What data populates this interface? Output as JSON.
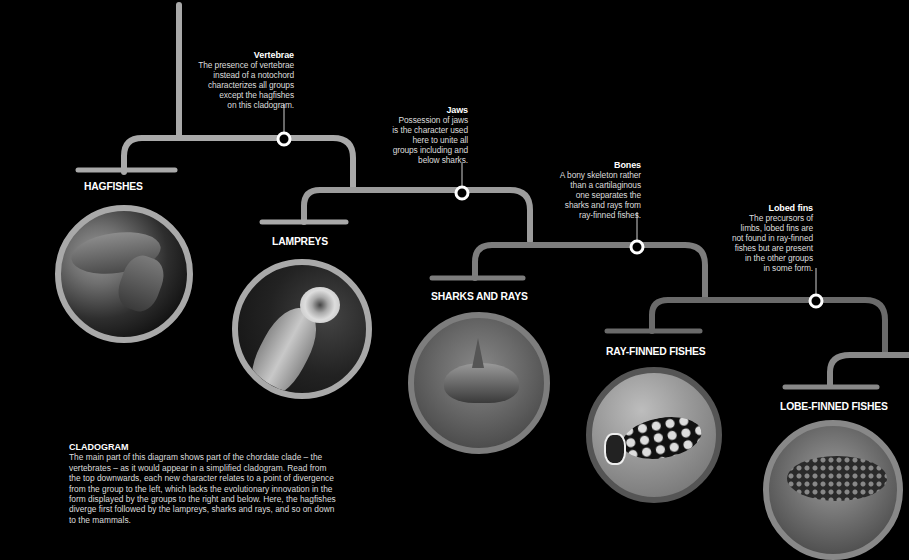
{
  "colors": {
    "background": "#000000",
    "branch_light": "#a9a9a9",
    "branch_mid": "#8a8a8a",
    "branch_dark": "#6a6a6a",
    "node_ring": "#ffffff",
    "text": "#ffffff"
  },
  "characters": [
    {
      "title": "Vertebrae",
      "text": "The presence of vertebrae instead of a notochord characterizes all groups except the hagfishes on this cladogram."
    },
    {
      "title": "Jaws",
      "text": "Possession of jaws is the character used here to unite all groups including and below sharks."
    },
    {
      "title": "Bones",
      "text": "A bony skeleton rather than a cartilaginous one separates the sharks and rays from ray-finned fishes."
    },
    {
      "title": "Lobed fins",
      "text": "The precursors of limbs, lobed fins are not found in ray-finned fishes but are present in the other groups in some form."
    }
  ],
  "char_lines": [
    [
      "The presence of vertebrae",
      "instead of a notochord",
      "characterizes all groups",
      "except the hagfishes",
      "on this cladogram."
    ],
    [
      "Possession of jaws",
      "is the character used",
      "here to unite all",
      "groups including and",
      "below sharks."
    ],
    [
      "A bony skeleton rather",
      "than a cartilaginous",
      "one separates the",
      "sharks and rays from",
      "ray-finned fishes."
    ],
    [
      "The precursors of",
      "limbs, lobed fins are",
      "not found in ray-finned",
      "fishes but are present",
      "in the other groups",
      "in some form."
    ]
  ],
  "groups": [
    {
      "name": "HAGFISHES",
      "photo": "hagfish-photo"
    },
    {
      "name": "LAMPREYS",
      "photo": "lamprey-photo"
    },
    {
      "name": "SHARKS AND RAYS",
      "photo": "shark-photo"
    },
    {
      "name": "RAY-FINNED FISHES",
      "photo": "triggerfish-photo"
    },
    {
      "name": "LOBE-FINNED FISHES",
      "photo": "coelacanth-photo"
    }
  ],
  "caption": {
    "title": "CLADOGRAM",
    "text": "The main part of this diagram shows part of the chordate clade – the vertebrates – as it would appear in a simplified cladogram. Read from the top downwards, each new character relates to a point of divergence from the group to the left, which lacks the evolutionary innovation in the form displayed by the groups to the right and below. Here, the hagfishes diverge first followed by the lampreys, sharks and rays, and so on down to the mammals."
  }
}
